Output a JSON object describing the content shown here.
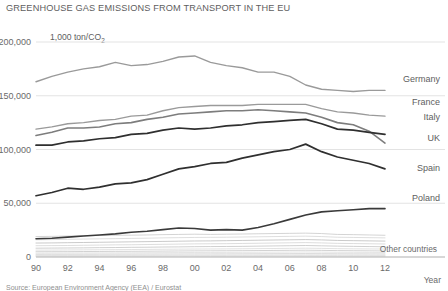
{
  "chart_data": {
    "type": "line",
    "title": "GREENHOUSE GAS EMISSIONS FROM TRANSPORT IN THE EU",
    "unit_label": "1,000 ton/CO",
    "unit_sub": "2",
    "xlabel": "Year",
    "ylabel": "",
    "grid": true,
    "legend_position": "right-inline",
    "ylim": [
      0,
      200000
    ],
    "yticks": [
      0,
      50000,
      100000,
      150000,
      200000
    ],
    "ytick_labels": [
      "0",
      "50,000",
      "100,000",
      "150,000",
      "200,000"
    ],
    "xlim": [
      1990,
      2012
    ],
    "xticks": [
      1990,
      1992,
      1994,
      1996,
      1998,
      2000,
      2002,
      2004,
      2006,
      2008,
      2010,
      2012
    ],
    "xtick_labels": [
      "90",
      "92",
      "94",
      "96",
      "98",
      "00",
      "02",
      "04",
      "06",
      "08",
      "10",
      "12"
    ],
    "x": [
      1990,
      1991,
      1992,
      1993,
      1994,
      1995,
      1996,
      1997,
      1998,
      1999,
      2000,
      2001,
      2002,
      2003,
      2004,
      2005,
      2006,
      2007,
      2008,
      2009,
      2010,
      2011,
      2012
    ],
    "series": [
      {
        "name": "Germany",
        "color": "#9a9a9a",
        "width": 1.4,
        "label_y": 82,
        "values": [
          163000,
          168000,
          172000,
          175000,
          177000,
          181000,
          178000,
          179000,
          182000,
          186000,
          187000,
          181000,
          178000,
          176000,
          172000,
          172000,
          168000,
          160000,
          156000,
          155000,
          154000,
          155000,
          155000
        ]
      },
      {
        "name": "France",
        "color": "#9a9a9a",
        "width": 1.4,
        "label_y": 105,
        "values": [
          119000,
          121000,
          124000,
          125000,
          127000,
          128000,
          131000,
          132000,
          136000,
          139000,
          140000,
          141000,
          141000,
          141000,
          142000,
          142000,
          142000,
          142000,
          138000,
          135000,
          134000,
          132000,
          131000
        ]
      },
      {
        "name": "Italy",
        "color": "#7d7d7d",
        "width": 1.6,
        "label_y": 120,
        "values": [
          113000,
          116000,
          120000,
          120000,
          121000,
          124000,
          125000,
          128000,
          130000,
          133000,
          134000,
          135000,
          136000,
          136000,
          137000,
          136000,
          135000,
          134000,
          130000,
          125000,
          123000,
          117000,
          106000
        ]
      },
      {
        "name": "UK",
        "color": "#2f2f2f",
        "width": 1.7,
        "label_y": 141,
        "values": [
          104000,
          104000,
          107000,
          108000,
          110000,
          111000,
          114000,
          115000,
          118000,
          120000,
          119000,
          120000,
          122000,
          123000,
          125000,
          126000,
          127000,
          128000,
          124000,
          119000,
          118000,
          116000,
          114000
        ]
      },
      {
        "name": "Spain",
        "color": "#2f2f2f",
        "width": 1.7,
        "label_y": 171,
        "values": [
          57000,
          60000,
          64000,
          63000,
          65000,
          68000,
          69000,
          72000,
          77000,
          82000,
          84000,
          87000,
          88000,
          92000,
          95000,
          98000,
          100000,
          105000,
          98000,
          93000,
          90000,
          87000,
          82000
        ]
      },
      {
        "name": "Poland",
        "color": "#3a3a3a",
        "width": 1.6,
        "label_y": 201,
        "values": [
          17000,
          17500,
          18500,
          19500,
          20500,
          21500,
          23000,
          24000,
          25500,
          27000,
          26500,
          25000,
          25500,
          25000,
          27500,
          31000,
          35000,
          39000,
          42000,
          43000,
          44000,
          45000,
          45000
        ]
      }
    ],
    "other_label": "Other countries",
    "other_band": [
      {
        "color": "#c9c9c9",
        "width": 0.8,
        "values": [
          19000,
          19200,
          19500,
          19800,
          20000,
          20200,
          20300,
          20500,
          20800,
          21000,
          21200,
          21000,
          21200,
          21400,
          21600,
          21800,
          22000,
          22200,
          21800,
          21000,
          20800,
          20500,
          20200
        ]
      },
      {
        "color": "#d0d0d0",
        "width": 0.7,
        "values": [
          16000,
          16200,
          16400,
          16700,
          16900,
          17100,
          17300,
          17500,
          17800,
          18000,
          18200,
          18300,
          18400,
          18600,
          18800,
          19000,
          19200,
          19400,
          19000,
          18400,
          18200,
          18000,
          17800
        ]
      },
      {
        "color": "#bcbcbc",
        "width": 0.8,
        "values": [
          13000,
          13100,
          13300,
          13500,
          13700,
          13900,
          14100,
          14300,
          14500,
          14700,
          14900,
          15000,
          15200,
          15400,
          15600,
          15800,
          16000,
          16200,
          15900,
          15400,
          15200,
          15000,
          14800
        ]
      },
      {
        "color": "#cfcfcf",
        "width": 0.7,
        "values": [
          10500,
          10600,
          10700,
          10900,
          11100,
          11300,
          11400,
          11600,
          11800,
          12000,
          12200,
          12300,
          12400,
          12600,
          12800,
          13000,
          13200,
          13400,
          13100,
          12700,
          12500,
          12300,
          12100
        ]
      },
      {
        "color": "#c4c4c4",
        "width": 0.8,
        "values": [
          8200,
          8300,
          8400,
          8500,
          8700,
          8800,
          9000,
          9100,
          9300,
          9400,
          9600,
          9700,
          9800,
          9900,
          10100,
          10300,
          10500,
          10700,
          10400,
          10100,
          9900,
          9700,
          9500
        ]
      },
      {
        "color": "#d4d4d4",
        "width": 0.7,
        "values": [
          6400,
          6450,
          6550,
          6650,
          6750,
          6850,
          6950,
          7050,
          7200,
          7300,
          7400,
          7450,
          7550,
          7650,
          7800,
          7900,
          8050,
          8200,
          8000,
          7750,
          7600,
          7500,
          7400
        ]
      },
      {
        "color": "#c7c7c7",
        "width": 0.8,
        "values": [
          4900,
          4950,
          5000,
          5100,
          5150,
          5250,
          5300,
          5400,
          5500,
          5600,
          5700,
          5750,
          5800,
          5900,
          6000,
          6100,
          6200,
          6300,
          6150,
          5950,
          5850,
          5750,
          5650
        ]
      },
      {
        "color": "#d8d8d8",
        "width": 0.7,
        "values": [
          3600,
          3650,
          3700,
          3750,
          3800,
          3850,
          3900,
          3980,
          4050,
          4120,
          4200,
          4250,
          4300,
          4380,
          4450,
          4520,
          4600,
          4680,
          4560,
          4420,
          4350,
          4280,
          4200
        ]
      },
      {
        "color": "#cbcbcb",
        "width": 0.7,
        "values": [
          2500,
          2530,
          2560,
          2600,
          2640,
          2680,
          2720,
          2760,
          2800,
          2850,
          2900,
          2930,
          2960,
          3000,
          3050,
          3100,
          3150,
          3200,
          3120,
          3030,
          2980,
          2930,
          2880
        ]
      },
      {
        "color": "#dadada",
        "width": 0.7,
        "values": [
          1600,
          1620,
          1640,
          1660,
          1690,
          1720,
          1740,
          1770,
          1800,
          1830,
          1860,
          1880,
          1900,
          1930,
          1960,
          2000,
          2030,
          2060,
          2010,
          1950,
          1920,
          1890,
          1860
        ]
      },
      {
        "color": "#d2d2d2",
        "width": 0.7,
        "values": [
          900,
          910,
          925,
          940,
          955,
          970,
          985,
          1000,
          1020,
          1040,
          1060,
          1070,
          1085,
          1100,
          1120,
          1140,
          1160,
          1180,
          1150,
          1115,
          1095,
          1075,
          1055
        ]
      },
      {
        "color": "#dddddd",
        "width": 0.7,
        "values": [
          400,
          405,
          412,
          420,
          428,
          436,
          444,
          452,
          460,
          470,
          480,
          485,
          492,
          500,
          510,
          520,
          530,
          540,
          525,
          510,
          500,
          490,
          480
        ]
      }
    ],
    "source_note": "Source: European Environment Agency (EEA) / Eurostat"
  }
}
